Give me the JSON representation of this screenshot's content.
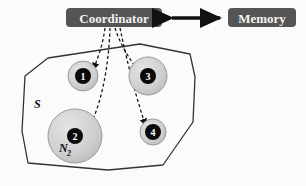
{
  "diagram": {
    "type": "system-architecture",
    "background_color": "#fbfbfb",
    "boxes": [
      {
        "id": "coordinator",
        "label": "Coordinator",
        "fill": "#555555",
        "text_color": "#f2f2f2",
        "x": 66,
        "y": 8,
        "width": 96,
        "height": 19
      },
      {
        "id": "memory",
        "label": "Memory",
        "fill": "#555555",
        "text_color": "#f2f2f2",
        "x": 228,
        "y": 8,
        "width": 68,
        "height": 19
      }
    ],
    "connector": {
      "id": "coordinator-memory-link",
      "kind": "double-headed-arrow",
      "color": "#111111",
      "x1": 172,
      "x2": 220,
      "y": 18
    },
    "region": {
      "id": "set-S",
      "label": "S",
      "stroke": "#333333",
      "fill": "none",
      "points": "48,58 25,76 22,131 28,163 108,170 163,165 193,122 195,77 190,54 140,44"
    },
    "agents": [
      {
        "id": "agent-1",
        "number": "1",
        "cx": 83,
        "cy": 76,
        "halo_r": 15,
        "core_r": 8,
        "halo_fill": "#cfcfcf",
        "core_fill": "#0a0a0a",
        "region_label": "",
        "region_label_sub": ""
      },
      {
        "id": "agent-3",
        "number": "3",
        "cx": 148,
        "cy": 76,
        "halo_r": 19,
        "core_r": 8,
        "halo_fill": "#cfcfcf",
        "core_fill": "#0a0a0a",
        "region_label": "",
        "region_label_sub": ""
      },
      {
        "id": "agent-2",
        "number": "2",
        "cx": 75,
        "cy": 136,
        "halo_r": 27,
        "core_r": 8,
        "halo_fill": "#cfcfcf",
        "core_fill": "#0a0a0a",
        "region_label": "N",
        "region_label_sub": "2"
      },
      {
        "id": "agent-4",
        "number": "4",
        "cx": 153,
        "cy": 132,
        "halo_r": 13,
        "core_r": 8,
        "halo_fill": "#cfcfcf",
        "core_fill": "#0a0a0a",
        "region_label": "",
        "region_label_sub": ""
      }
    ],
    "links": [
      {
        "id": "link-coordinator-agent-1",
        "target": "agent-1",
        "path": "M 105,28 C 103,44 98,58 93,70",
        "style": "dashed",
        "color": "#111111"
      },
      {
        "id": "link-coordinator-agent-2",
        "target": "agent-2",
        "path": "M 110,28 C 109,60 103,105 86,133",
        "style": "dashed",
        "color": "#111111"
      },
      {
        "id": "link-coordinator-agent-3",
        "target": "agent-3",
        "path": "M 115,28 C 120,44 130,60 138,70",
        "style": "dashed",
        "color": "#111111"
      },
      {
        "id": "link-coordinator-agent-4",
        "target": "agent-4",
        "path": "M 120,28 C 127,62 138,105 146,126",
        "style": "dashed",
        "color": "#111111"
      }
    ]
  }
}
